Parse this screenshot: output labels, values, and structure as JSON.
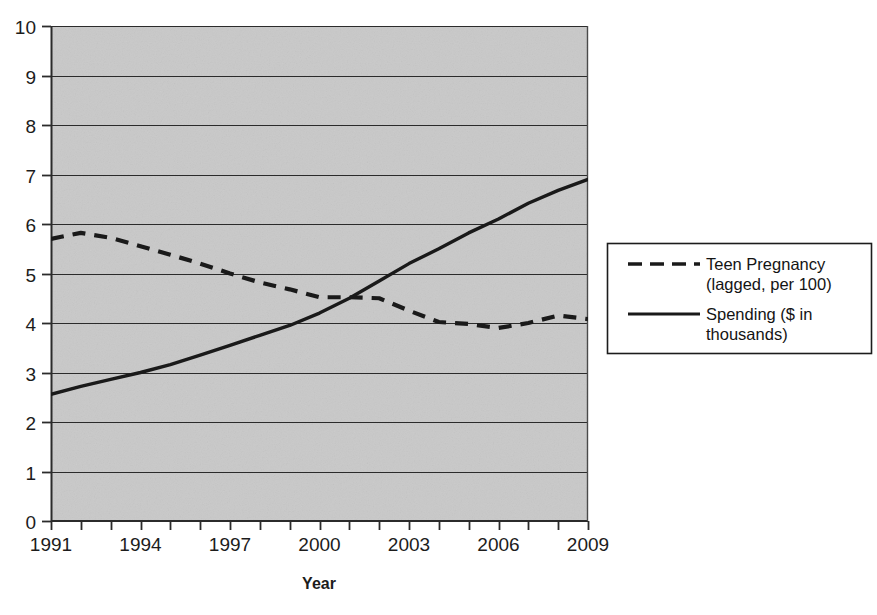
{
  "chart_data": {
    "type": "line",
    "title": "",
    "xlabel": "Year",
    "ylabel": "",
    "xlim": [
      1991,
      2009
    ],
    "ylim": [
      0,
      10
    ],
    "grid": true,
    "grid_axis": "y",
    "legend_position": "right",
    "plot_background": "#c9c9c9",
    "x": [
      1991,
      1992,
      1993,
      1994,
      1995,
      1996,
      1997,
      1998,
      1999,
      2000,
      2001,
      2002,
      2003,
      2004,
      2005,
      2006,
      2007,
      2008,
      2009
    ],
    "x_tick_labels": [
      "1991",
      "1994",
      "1997",
      "2000",
      "2003",
      "2006",
      "2009"
    ],
    "x_tick_values": [
      1991,
      1994,
      1997,
      2000,
      2003,
      2006,
      2009
    ],
    "x_minor_ticks": [
      1991,
      1992,
      1993,
      1994,
      1995,
      1996,
      1997,
      1998,
      1999,
      2000,
      2001,
      2002,
      2003,
      2004,
      2005,
      2006,
      2007,
      2008,
      2009
    ],
    "y_tick_labels": [
      "0",
      "1",
      "2",
      "3",
      "4",
      "5",
      "6",
      "7",
      "8",
      "9",
      "10"
    ],
    "y_tick_values": [
      0,
      1,
      2,
      3,
      4,
      5,
      6,
      7,
      8,
      9,
      10
    ],
    "series": [
      {
        "name": "Teen Pregnancy (lagged, per 100)",
        "style": "dashed",
        "color": "#1a1a1a",
        "values": [
          5.7,
          5.82,
          5.72,
          5.55,
          5.38,
          5.2,
          5.0,
          4.82,
          4.68,
          4.52,
          4.52,
          4.5,
          4.25,
          4.02,
          3.98,
          3.9,
          4.0,
          4.15,
          4.08
        ]
      },
      {
        "name": "Spending ($ in thousands)",
        "style": "solid",
        "color": "#1a1a1a",
        "values": [
          2.56,
          2.72,
          2.86,
          3.0,
          3.16,
          3.35,
          3.55,
          3.75,
          3.95,
          4.2,
          4.5,
          4.85,
          5.2,
          5.5,
          5.82,
          6.1,
          6.42,
          6.68,
          6.9
        ]
      }
    ]
  },
  "legend": {
    "entries": [
      {
        "label_line1": "Teen Pregnancy",
        "label_line2": "(lagged, per 100)",
        "style": "dashed"
      },
      {
        "label_line1": "Spending ($ in",
        "label_line2": "thousands)",
        "style": "solid"
      }
    ]
  },
  "axis": {
    "x_title": "Year"
  }
}
